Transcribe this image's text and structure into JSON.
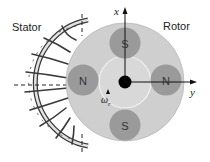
{
  "diagram": {
    "labels": {
      "stator": "Stator",
      "rotor": "Rotor",
      "x_axis": "x",
      "y_axis": "y",
      "omega": "ω",
      "omega_sub": "r"
    },
    "magnets": [
      {
        "pole": "S",
        "position": "top"
      },
      {
        "pole": "N",
        "position": "left"
      },
      {
        "pole": "N",
        "position": "right"
      },
      {
        "pole": "S",
        "position": "bottom"
      }
    ],
    "colors": {
      "rotor_fill": "#cfcfcf",
      "magnet_fill": "#9a9a9a",
      "inner_circle_fill": "#d8d8d8",
      "stator_frame": "#3a3a3a",
      "stator_ring_fill": "#e2e2e2",
      "hub": "#000000",
      "axis": "#111111"
    }
  }
}
